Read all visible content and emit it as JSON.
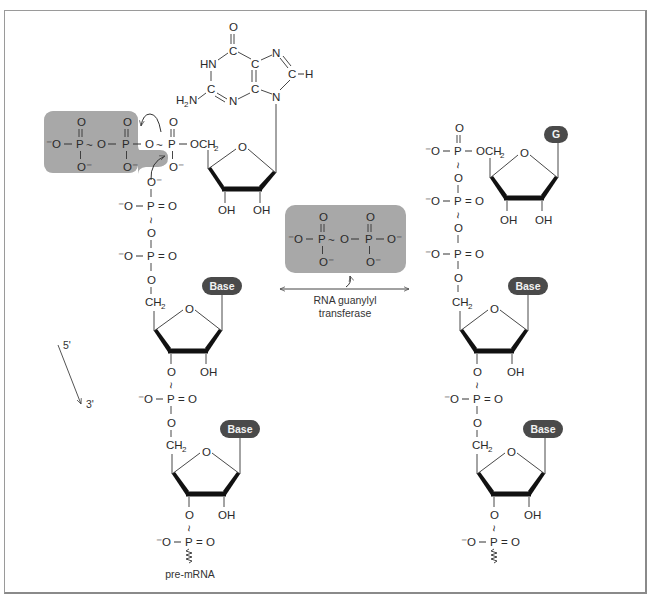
{
  "figure": {
    "colors": {
      "frame": "#8a8a8a",
      "shaded_box": "#a8a8a8",
      "base_pill": "#4a4a4a",
      "pill_text": "#f2f2f2",
      "text": "#2a2a2a"
    }
  },
  "atoms": {
    "O": "O",
    "Ominus": "O⁻",
    "minusO": "⁻O",
    "P": "P",
    "CH2": "CH",
    "sub2": "2",
    "OCH2": "OCH",
    "OH": "OH",
    "HN": "HN",
    "N": "N",
    "C": "C",
    "H": "H",
    "H2N": "H",
    "N_after_H2": "N",
    "dash": "–",
    "eq": "=",
    "tilde": "~"
  },
  "gtp": {
    "base_name": "Guanine",
    "leaving_group_label": "pyrophosphate (shaded)"
  },
  "pyrophosphate_box": {
    "left_label": "⁻O – P ~ O – P – O⁻"
  },
  "enzyme": {
    "label_line1": "RNA guanylyl",
    "label_line2": "transferase"
  },
  "direction": {
    "five_prime": "5'",
    "three_prime": "3'"
  },
  "pills": {
    "base": "Base",
    "g": "G"
  },
  "strand_label": "pre-mRNA"
}
